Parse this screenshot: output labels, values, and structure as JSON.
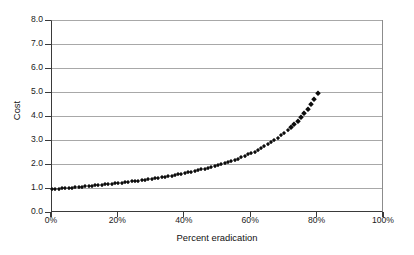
{
  "figure": {
    "background_color": "#ffffff",
    "frame_color": "#3a3a3a",
    "grid_color": "#a8a8a8",
    "marker_color": "#0d0d0d"
  },
  "axes": {
    "y_title": "Cost",
    "x_title": "Percent eradication",
    "y_ticks": [
      "0.0",
      "1.0",
      "2.0",
      "3.0",
      "4.0",
      "5.0",
      "6.0",
      "7.0",
      "8.0"
    ],
    "x_ticks": [
      "0%",
      "20%",
      "40%",
      "60%",
      "80%",
      "100%"
    ]
  },
  "chart_data": {
    "type": "scatter",
    "title": "",
    "xlabel": "Percent eradication",
    "ylabel": "Cost",
    "xlim": [
      0,
      100
    ],
    "ylim": [
      0,
      8
    ],
    "xtick_values": [
      0,
      20,
      40,
      60,
      80,
      100
    ],
    "xtick_labels": [
      "0%",
      "20%",
      "40%",
      "60%",
      "80%",
      "100%"
    ],
    "ytick_values": [
      0,
      1,
      2,
      3,
      4,
      5,
      6,
      7,
      8
    ],
    "ytick_labels": [
      "0.0",
      "1.0",
      "2.0",
      "3.0",
      "4.0",
      "5.0",
      "6.0",
      "7.0",
      "8.0"
    ],
    "grid": true,
    "grid_axis": "y",
    "legend": false,
    "marker": "diamond",
    "marker_size_px": 3,
    "series": [
      {
        "name": "Cost of eradication",
        "x": [
          0,
          1,
          2,
          3,
          4,
          5,
          6,
          7,
          8,
          9,
          10,
          11,
          12,
          13,
          14,
          15,
          16,
          17,
          18,
          19,
          20,
          21,
          22,
          23,
          24,
          25,
          26,
          27,
          28,
          29,
          30,
          31,
          32,
          33,
          34,
          35,
          36,
          37,
          38,
          39,
          40,
          41,
          42,
          43,
          44,
          45,
          46,
          47,
          48,
          49,
          50,
          51,
          52,
          53,
          54,
          55,
          56,
          57,
          58,
          59,
          60,
          61,
          62,
          63,
          64,
          65,
          66,
          67,
          68,
          69,
          70,
          71,
          72,
          73,
          74,
          75,
          76,
          77,
          78,
          79,
          80
        ],
        "y": [
          1.0,
          1.01,
          1.02,
          1.03,
          1.04,
          1.05,
          1.06,
          1.08,
          1.09,
          1.1,
          1.11,
          1.12,
          1.14,
          1.15,
          1.16,
          1.18,
          1.19,
          1.21,
          1.22,
          1.24,
          1.25,
          1.27,
          1.28,
          1.3,
          1.32,
          1.33,
          1.35,
          1.37,
          1.39,
          1.41,
          1.43,
          1.45,
          1.47,
          1.49,
          1.52,
          1.54,
          1.56,
          1.59,
          1.61,
          1.64,
          1.67,
          1.69,
          1.72,
          1.75,
          1.79,
          1.82,
          1.85,
          1.89,
          1.92,
          1.96,
          2.0,
          2.04,
          2.08,
          2.13,
          2.17,
          2.22,
          2.27,
          2.33,
          2.38,
          2.44,
          2.5,
          2.56,
          2.63,
          2.7,
          2.78,
          2.86,
          2.94,
          3.03,
          3.13,
          3.23,
          3.33,
          3.45,
          3.57,
          3.7,
          3.85,
          4.0,
          4.17,
          4.35,
          4.55,
          4.76,
          5.0
        ],
        "color": "#0d0d0d"
      }
    ],
    "note": "Cost rises slowly from 1.0 at 0% eradication, passing 2.0 near 50%, 3.0 near 62%, 4.0 near 70%, 5.0 near 75% and reaching about 7.0 at 80%; no points are plotted beyond 80%."
  }
}
